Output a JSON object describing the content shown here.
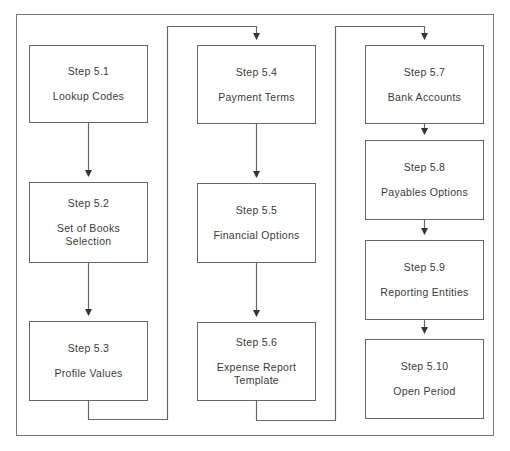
{
  "diagram": {
    "type": "flowchart",
    "colors": {
      "line": "#666666",
      "text": "#3a3a3a",
      "background": "#ffffff"
    },
    "columns": [
      {
        "steps": [
          {
            "id": "5.1",
            "step": "Step 5.1",
            "label": "Lookup Codes"
          },
          {
            "id": "5.2",
            "step": "Step 5.2",
            "label": "Set of Books Selection"
          },
          {
            "id": "5.3",
            "step": "Step 5.3",
            "label": "Profile Values"
          }
        ]
      },
      {
        "steps": [
          {
            "id": "5.4",
            "step": "Step 5.4",
            "label": "Payment Terms"
          },
          {
            "id": "5.5",
            "step": "Step 5.5",
            "label": "Financial Options"
          },
          {
            "id": "5.6",
            "step": "Step 5.6",
            "label": "Expense Report Template"
          }
        ]
      },
      {
        "steps": [
          {
            "id": "5.7",
            "step": "Step 5.7",
            "label": "Bank Accounts"
          },
          {
            "id": "5.8",
            "step": "Step 5.8",
            "label": "Payables Options"
          },
          {
            "id": "5.9",
            "step": "Step 5.9",
            "label": "Reporting Entities"
          },
          {
            "id": "5.10",
            "step": "Step 5.10",
            "label": "Open Period"
          }
        ]
      }
    ],
    "edges": [
      [
        "5.1",
        "5.2"
      ],
      [
        "5.2",
        "5.3"
      ],
      [
        "5.3",
        "5.4"
      ],
      [
        "5.4",
        "5.5"
      ],
      [
        "5.5",
        "5.6"
      ],
      [
        "5.6",
        "5.7"
      ],
      [
        "5.7",
        "5.8"
      ],
      [
        "5.8",
        "5.9"
      ],
      [
        "5.9",
        "5.10"
      ]
    ]
  }
}
